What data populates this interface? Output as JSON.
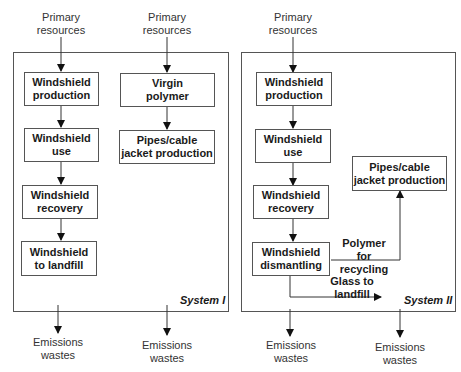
{
  "system1": {
    "name": "System I",
    "inputs": [
      {
        "label_line1": "Primary",
        "label_line2": "resources"
      },
      {
        "label_line1": "Primary",
        "label_line2": "resources"
      }
    ],
    "chain_windshield": [
      {
        "line1": "Windshield",
        "line2": "production"
      },
      {
        "line1": "Windshield",
        "line2": "use"
      },
      {
        "line1": "Windshield",
        "line2": "recovery"
      },
      {
        "line1": "Windshield",
        "line2": "to landfill"
      }
    ],
    "chain_polymer": [
      {
        "line1": "Virgin",
        "line2": "polymer"
      },
      {
        "line1": "Pipes/cable",
        "line2": "jacket production"
      }
    ],
    "outputs": [
      {
        "line1": "Emissions",
        "line2": "wastes"
      },
      {
        "line1": "Emissions",
        "line2": "wastes"
      }
    ]
  },
  "system2": {
    "name": "System II",
    "input": {
      "label_line1": "Primary",
      "label_line2": "resources"
    },
    "chain_windshield": [
      {
        "line1": "Windshield",
        "line2": "production"
      },
      {
        "line1": "Windshield",
        "line2": "use"
      },
      {
        "line1": "Windshield",
        "line2": "recovery"
      },
      {
        "line1": "Windshield",
        "line2": "dismantling"
      }
    ],
    "pipes": {
      "line1": "Pipes/cable",
      "line2": "jacket production"
    },
    "flow_polymer": {
      "line1": "Polymer for",
      "line2": "recycling"
    },
    "flow_glass": {
      "line1": "Glass to",
      "line2": "landfill"
    },
    "outputs": [
      {
        "line1": "Emissions",
        "line2": "wastes"
      },
      {
        "line1": "Emissions",
        "line2": "wastes"
      }
    ]
  }
}
